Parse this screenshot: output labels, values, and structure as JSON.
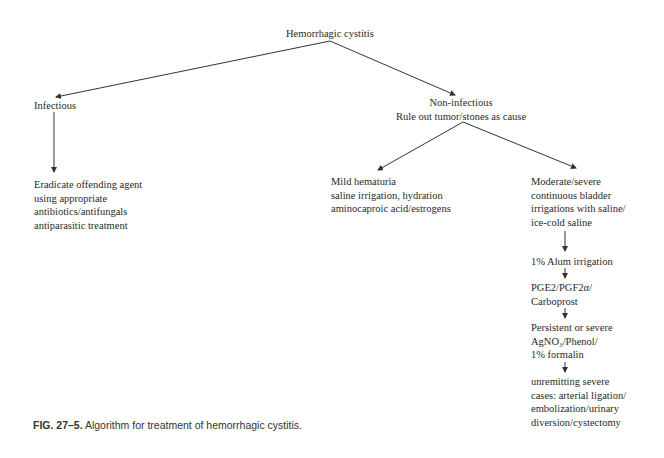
{
  "diagram": {
    "root": "Hemorrhagic cystitis",
    "infectious": {
      "label": "Infectious",
      "action": [
        "Eradicate offending agent",
        "using appropriate",
        "antibiotics/antifungals",
        "antiparasitic treatment"
      ]
    },
    "non_infectious": {
      "label": [
        "Non-infectious",
        "Rule out tumor/stones as cause"
      ],
      "mild": [
        "Mild hematuria",
        "saline irrigation, hydration",
        "aminocaproic acid/estrogens"
      ],
      "moderate_severe": [
        "Moderate/severe",
        "continuous bladder",
        "irrigations with saline/",
        "ice-cold saline"
      ],
      "steps": [
        [
          "1% Alum irrigation"
        ],
        [
          "PGE2/PGF2α/",
          "Carboprost"
        ],
        [
          "Persistent or severe",
          "AgNO₃/Phenol/",
          "1% formalin"
        ],
        [
          "unremitting severe",
          "cases: arterial ligation/",
          "embolization/urinary",
          "diversion/cystectomy"
        ]
      ]
    }
  },
  "caption": {
    "label": "FIG. 27–5.",
    "text": " Algorithm for treatment of hemorrhagic cystitis."
  },
  "colors": {
    "line": "#333333",
    "text": "#2a2a2a"
  }
}
